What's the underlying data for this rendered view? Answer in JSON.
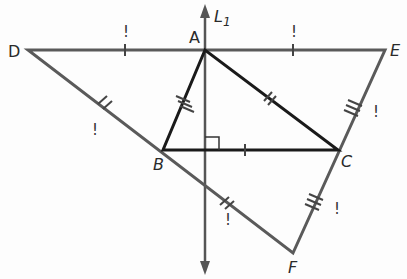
{
  "diagram": {
    "points": {
      "D": {
        "label": "D",
        "x": 28,
        "y": 50
      },
      "A": {
        "label": "A",
        "x": 205,
        "y": 50
      },
      "E": {
        "label": "E",
        "x": 385,
        "y": 50
      },
      "B": {
        "label": "B",
        "x": 163,
        "y": 150
      },
      "C": {
        "label": "C",
        "x": 338,
        "y": 150
      },
      "F": {
        "label": "F",
        "x": 293,
        "y": 253
      }
    },
    "line_label": "L",
    "line_label_sub": "1",
    "prime_mark": "!",
    "colors": {
      "outer": "#5a5a5a",
      "inner": "#1a1a1a"
    }
  }
}
